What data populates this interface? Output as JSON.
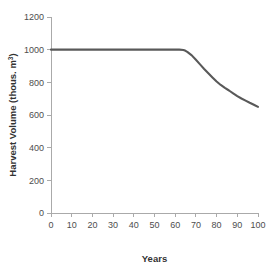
{
  "chart_data": {
    "type": "line",
    "title": "",
    "subtitle": "",
    "xlabel": "Years",
    "ylabel": "Harvest Volume (thous. m",
    "ylabel_superscript": "3",
    "ylabel_suffix": ")",
    "xlim": [
      0,
      100
    ],
    "ylim": [
      0,
      1200
    ],
    "grid": false,
    "legend": false,
    "legend_position": "none",
    "x_ticks": [
      0,
      10,
      20,
      30,
      40,
      50,
      60,
      70,
      80,
      90,
      100
    ],
    "x_tick_labels": [
      "0",
      "10",
      "20",
      "30",
      "40",
      "50",
      "60",
      "70",
      "80",
      "90",
      "100"
    ],
    "y_ticks": [
      0,
      200,
      400,
      600,
      800,
      1000,
      1200
    ],
    "y_tick_labels": [
      "0",
      "200",
      "400",
      "600",
      "800",
      "1000",
      "1200"
    ],
    "series": [
      {
        "name": "Harvest Volume",
        "color": "#595959",
        "x": [
          0,
          5,
          10,
          15,
          20,
          25,
          30,
          35,
          40,
          45,
          50,
          55,
          60,
          62,
          64,
          65,
          66,
          68,
          70,
          72,
          74,
          76,
          78,
          80,
          82,
          84,
          86,
          88,
          90,
          92,
          94,
          96,
          98,
          100
        ],
        "values": [
          1000,
          1000,
          1000,
          1000,
          1000,
          1000,
          1000,
          1000,
          1000,
          1000,
          1000,
          1000,
          1000,
          1000,
          998,
          993,
          985,
          965,
          938,
          910,
          882,
          856,
          830,
          805,
          784,
          766,
          750,
          733,
          716,
          701,
          688,
          675,
          663,
          650
        ]
      }
    ]
  },
  "axes": {
    "x_axis_name": "x-axis",
    "y_axis_name": "y-axis"
  }
}
